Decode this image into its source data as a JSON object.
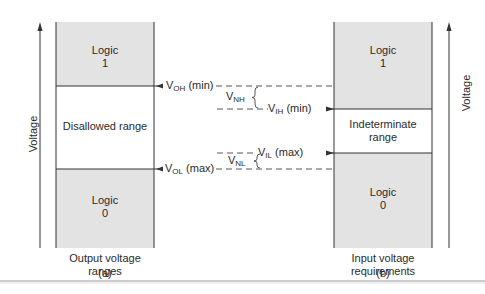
{
  "diagram": {
    "axis_label": "Voltage",
    "left": {
      "logic_high": {
        "line1": "Logic",
        "line2": "1"
      },
      "middle": "Disallowed range",
      "logic_low": {
        "line1": "Logic",
        "line2": "0"
      },
      "caption": {
        "line1": "Output voltage",
        "line2": "ranges"
      },
      "tag": "(a)"
    },
    "right": {
      "logic_high": {
        "line1": "Logic",
        "line2": "1"
      },
      "middle": {
        "line1": "Indeterminate",
        "line2": "range"
      },
      "logic_low": {
        "line1": "Logic",
        "line2": "0"
      },
      "caption": {
        "line1": "Input voltage",
        "line2": "requirements"
      },
      "tag": "(b)"
    },
    "levels": {
      "voh": {
        "main": "V",
        "sub": "OH",
        "suffix": " (min)"
      },
      "vih": {
        "main": "V",
        "sub": "IH",
        "suffix": " (min)"
      },
      "vil": {
        "main": "V",
        "sub": "IL",
        "suffix": " (max)"
      },
      "vol": {
        "main": "V",
        "sub": "OL",
        "suffix": " (max)"
      },
      "vnh": {
        "main": "V",
        "sub": "NH"
      },
      "vnl": {
        "main": "V",
        "sub": "NL"
      }
    },
    "colors": {
      "logic_fill": "#e3e3e3",
      "line": "#333333",
      "text": "#2a2a2a"
    }
  }
}
